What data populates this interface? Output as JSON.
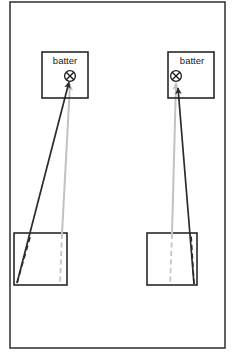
{
  "figure": {
    "type": "diagram",
    "width": 238,
    "height": 361,
    "background_color": "#ffffff",
    "frame": {
      "name": "outer-frame",
      "x": 10,
      "y": 2,
      "width": 215,
      "height": 346,
      "stroke_color": "#3a3a3a",
      "stroke_width": 1.6,
      "fill": "none"
    },
    "colors": {
      "dark_stroke": "#2b2b2b",
      "gray_stroke": "#c2c2c2",
      "box_stroke": "#1a1a1a",
      "text": "#1a1a1a"
    },
    "panels": [
      {
        "id": "left-panel",
        "name": "left-trajectory-panel",
        "batter_box": {
          "name": "batter-box-left",
          "label": "batter",
          "x": 42,
          "y": 52,
          "width": 46,
          "height": 46,
          "label_x": 65,
          "label_y": 61
        },
        "impact_marker": {
          "name": "impact-marker-left",
          "symbol": "circle-x",
          "cx": 70,
          "cy": 76,
          "r": 5.4
        },
        "source_rect": {
          "name": "source-rect-left",
          "x": 14,
          "y": 233,
          "width": 53,
          "height": 52
        },
        "dark_arrow": {
          "name": "dark-trajectory-arrow-left",
          "x1": 17,
          "y1": 283,
          "x2": 69,
          "y2": 82,
          "color": "#2b2b2b",
          "width": 1.7,
          "arrowhead": "solid"
        },
        "gray_arrow": {
          "name": "gray-trajectory-arrow-left",
          "x1": 62,
          "y1": 234,
          "x2": 70,
          "y2": 84,
          "color": "#c2c2c2",
          "width": 2.0,
          "arrowhead": "solid"
        },
        "dark_dashed": {
          "name": "dark-dashed-segment-left",
          "x1": 17,
          "y1": 283,
          "x2": 31,
          "y2": 234,
          "color": "#2b2b2b",
          "width": 1.6,
          "dash": "5,3.5"
        },
        "gray_dashed": {
          "name": "gray-dashed-segment-left",
          "x1": 62,
          "y1": 234,
          "x2": 60,
          "y2": 285,
          "color": "#c2c2c2",
          "width": 1.7,
          "dash": "5,3.5"
        }
      },
      {
        "id": "right-panel",
        "name": "right-trajectory-panel",
        "batter_box": {
          "name": "batter-box-right",
          "label": "batter",
          "x": 168,
          "y": 52,
          "width": 46,
          "height": 46,
          "label_x": 192,
          "label_y": 61
        },
        "impact_marker": {
          "name": "impact-marker-right",
          "symbol": "circle-x",
          "cx": 176,
          "cy": 76,
          "r": 5.4
        },
        "source_rect": {
          "name": "source-rect-right",
          "x": 147,
          "y": 233,
          "width": 50,
          "height": 52
        },
        "dark_arrow": {
          "name": "dark-trajectory-arrow-right",
          "x1": 194,
          "y1": 284,
          "x2": 178,
          "y2": 88,
          "color": "#2b2b2b",
          "width": 1.7,
          "arrowhead": "solid"
        },
        "gray_arrow": {
          "name": "gray-trajectory-arrow-right",
          "x1": 172,
          "y1": 234,
          "x2": 176,
          "y2": 83,
          "color": "#c2c2c2",
          "width": 2.0,
          "arrowhead": "solid"
        },
        "dark_dashed": {
          "name": "dark-dashed-segment-right",
          "x1": 194,
          "y1": 284,
          "x2": 191,
          "y2": 234,
          "color": "#2b2b2b",
          "width": 1.6,
          "dash": "5,3.5"
        },
        "gray_dashed": {
          "name": "gray-dashed-segment-right",
          "x1": 172,
          "y1": 234,
          "x2": 170,
          "y2": 285,
          "color": "#c2c2c2",
          "width": 1.7,
          "dash": "5,3.5"
        }
      }
    ]
  }
}
